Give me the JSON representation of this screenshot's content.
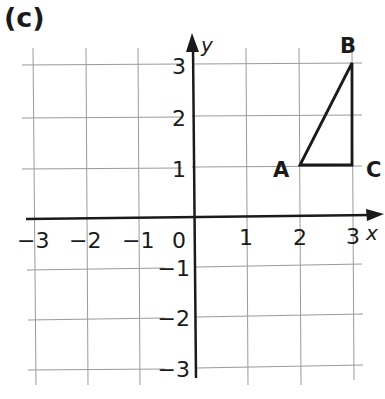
{
  "part_label": "(c)",
  "axes": {
    "x_label": "x",
    "y_label": "y",
    "x_ticks": [
      "−3",
      "−2",
      "−1",
      "0",
      "1",
      "2",
      "3"
    ],
    "y_ticks_positive": [
      "1",
      "2",
      "3"
    ],
    "y_ticks_negative": [
      "−1",
      "−2",
      "−3"
    ],
    "x_range": [
      -3,
      3
    ],
    "y_range": [
      -3,
      3
    ]
  },
  "triangle": {
    "vertices": [
      {
        "label": "A",
        "x": 2,
        "y": 1
      },
      {
        "label": "B",
        "x": 3,
        "y": 3
      },
      {
        "label": "C",
        "x": 3,
        "y": 1
      }
    ]
  },
  "colors": {
    "grid": "#9a9a9a",
    "axis": "#1a1a1a",
    "shape": "#1a1a1a",
    "background": "#ffffff"
  }
}
